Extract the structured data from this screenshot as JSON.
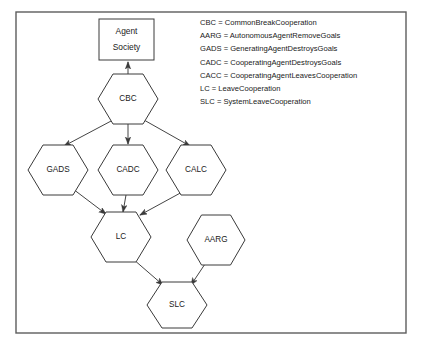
{
  "figure": {
    "frame": {
      "x": 16,
      "y": 12,
      "width": 390,
      "height": 321
    },
    "colors": {
      "background": "#ffffff",
      "frame_stroke": "#5d5d5d",
      "node_stroke": "#3a3a3a",
      "text": "#1a1a1a"
    }
  },
  "root_box": {
    "label_line1": "Agent",
    "label_line2": "Society",
    "x": 99,
    "y": 19,
    "width": 55,
    "height": 41
  },
  "nodes": [
    {
      "id": "CBC",
      "label": "CBC",
      "cx": 128,
      "cy": 99,
      "rx": 30,
      "ry": 25
    },
    {
      "id": "GADS",
      "label": "GADS",
      "cx": 58,
      "cy": 170,
      "rx": 30,
      "ry": 25
    },
    {
      "id": "CADC",
      "label": "CADC",
      "cx": 128,
      "cy": 170,
      "rx": 30,
      "ry": 25
    },
    {
      "id": "CALC",
      "label": "CALC",
      "cx": 196,
      "cy": 170,
      "rx": 30,
      "ry": 25
    },
    {
      "id": "LC",
      "label": "LC",
      "cx": 121,
      "cy": 237,
      "rx": 30,
      "ry": 25
    },
    {
      "id": "AARG",
      "label": "AARG",
      "cx": 216,
      "cy": 240,
      "rx": 29,
      "ry": 25
    },
    {
      "id": "SLC",
      "label": "SLC",
      "cx": 177,
      "cy": 305,
      "rx": 30,
      "ry": 23
    }
  ],
  "edges": [
    {
      "from": "CBC",
      "to": "AgentSociety",
      "x1": 128,
      "y1": 74,
      "x2": 128,
      "y2": 62
    },
    {
      "from": "CBC",
      "to": "GADS",
      "x1": 113,
      "y1": 120,
      "x2": 64,
      "y2": 146
    },
    {
      "from": "CBC",
      "to": "CADC",
      "x1": 128,
      "y1": 124,
      "x2": 128,
      "y2": 144
    },
    {
      "from": "CBC",
      "to": "CALC",
      "x1": 144,
      "y1": 120,
      "x2": 190,
      "y2": 146
    },
    {
      "from": "GADS",
      "to": "LC",
      "x1": 73,
      "y1": 189,
      "x2": 106,
      "y2": 214
    },
    {
      "from": "CADC",
      "to": "LC",
      "x1": 126,
      "y1": 195,
      "x2": 123,
      "y2": 212
    },
    {
      "from": "CALC",
      "to": "LC",
      "x1": 184,
      "y1": 191,
      "x2": 140,
      "y2": 215
    },
    {
      "from": "LC",
      "to": "SLC",
      "x1": 133,
      "y1": 259,
      "x2": 163,
      "y2": 285
    },
    {
      "from": "AARG",
      "to": "SLC",
      "x1": 207,
      "y1": 261,
      "x2": 191,
      "y2": 285
    }
  ],
  "legend": {
    "x": 200,
    "y_start": 23,
    "line_height": 13.2,
    "entries": [
      "CBC = CommonBreakCooperation",
      "AARG = AutonomousAgentRemoveGoals",
      "GADS = GeneratingAgentDestroysGoals",
      "CADC = CooperatingAgentDestroysGoals",
      "CACC = CooperatingAgentLeavesCooperation",
      "LC = LeaveCooperation",
      "SLC = SystemLeaveCooperation"
    ]
  }
}
